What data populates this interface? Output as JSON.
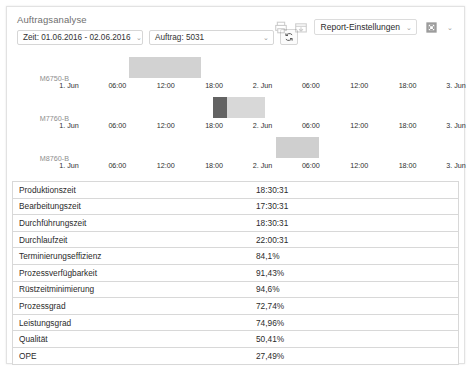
{
  "panel": {
    "title": "Auftragsanalyse"
  },
  "filters": {
    "date_range": {
      "label": "Zeit: 01.06.2016 - 02.06.2016",
      "caret": "⌄"
    },
    "order": {
      "label": "Auftrag: 5031",
      "caret": "⌄"
    },
    "refresh_icon": "refresh-icon"
  },
  "toolbar": {
    "print_icon": "print-icon",
    "export_icon": "export-icon",
    "report_settings": {
      "label": "Report-Einstellungen",
      "caret": "⌄"
    },
    "fullscreen": {
      "icon": "fullscreen-icon",
      "caret": "⌄"
    }
  },
  "chart_data": {
    "type": "bar",
    "title": "",
    "xlabel": "",
    "ylabel": "",
    "grid": false,
    "legend_position": "none",
    "x_axis": {
      "min": "01.06.2016 00:00",
      "max": "03.06.2016 00:00",
      "ticks": [
        "1. Jun",
        "06:00",
        "12:00",
        "18:00",
        "2. Jun",
        "06:00",
        "12:00",
        "18:00",
        "3. Jun"
      ],
      "tick_positions_pct": [
        0,
        12.5,
        25,
        37.5,
        50,
        62.5,
        75,
        87.5,
        100
      ]
    },
    "rows": [
      {
        "label": "M6750-B",
        "segments": [
          {
            "start_pct": 15.5,
            "width_pct": 18.5,
            "color": "#d2d2d2"
          }
        ]
      },
      {
        "label": "M7760-B",
        "segments": [
          {
            "start_pct": 37.2,
            "width_pct": 3.7,
            "color": "#636363"
          },
          {
            "start_pct": 40.9,
            "width_pct": 9.8,
            "color": "#d8d8d8"
          }
        ]
      },
      {
        "label": "M8760-B",
        "segments": [
          {
            "start_pct": 53.5,
            "width_pct": 11.0,
            "color": "#cfcfcf"
          }
        ]
      }
    ]
  },
  "metrics": {
    "columns": [
      "Kennzahl",
      "Wert"
    ],
    "rows": [
      {
        "key": "Produktionszeit",
        "value": "18:30:31"
      },
      {
        "key": "Bearbeitungszeit",
        "value": "17:30:31"
      },
      {
        "key": "Durchführungszeit",
        "value": "18:30:31"
      },
      {
        "key": "Durchlaufzeit",
        "value": "22:00:31"
      },
      {
        "key": "Terminierungseffizienz",
        "value": "84,1%"
      },
      {
        "key": "Prozessverfügbarkeit",
        "value": "91,43%"
      },
      {
        "key": "Rüstzeitminimierung",
        "value": "94,6%"
      },
      {
        "key": "Prozessgrad",
        "value": "72,74%"
      },
      {
        "key": "Leistungsgrad",
        "value": "74,96%"
      },
      {
        "key": "Qualität",
        "value": "50,41%"
      },
      {
        "key": "OPE",
        "value": "27,49%"
      }
    ]
  },
  "colors": {
    "panel_border": "#e2e2e2",
    "table_border": "#d8d8d8",
    "text": "#2b2b2b",
    "muted": "#8e8e8e",
    "bar_light": "#d2d2d2",
    "bar_dark": "#636363"
  }
}
